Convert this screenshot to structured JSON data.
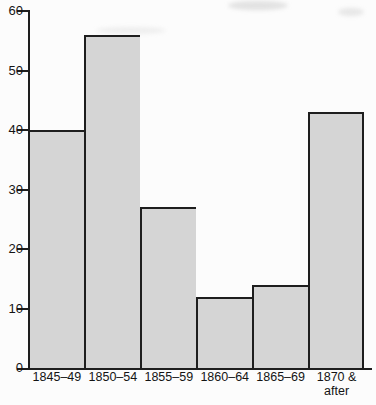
{
  "chart_data": {
    "type": "bar",
    "title": "",
    "xlabel": "",
    "ylabel": "",
    "categories": [
      "1845–49",
      "1850–54",
      "1855–59",
      "1860–64",
      "1865–69",
      "1870 & after"
    ],
    "values": [
      40,
      56,
      27,
      12,
      14,
      43
    ],
    "ylim": [
      0,
      60
    ],
    "yticks": [
      0,
      10,
      20,
      30,
      40,
      50,
      60
    ],
    "grid": false,
    "legend": "none",
    "bar_fill_color": "#d5d5d5",
    "bar_border_color": "#1e1e1e",
    "axis_color": "#1e1e1e",
    "text_color": "#141414",
    "background_color": "#fcfcfc"
  }
}
